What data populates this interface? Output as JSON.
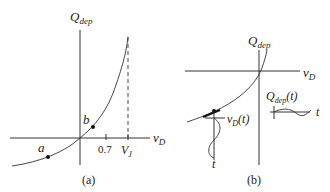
{
  "panel_a": {
    "caption": "(a)",
    "y_label_main": "Q",
    "y_label_sub": "dep",
    "x_label_main": "v",
    "x_label_sub": "D",
    "tick_07": "0.7",
    "tick_vj_main": "V",
    "tick_vj_sub": "J",
    "point_a": "a",
    "point_b": "b"
  },
  "panel_b": {
    "caption": "(b)",
    "y_label_main": "Q",
    "y_label_sub": "dep",
    "x_label_main": "v",
    "x_label_sub": "D",
    "vd_t_main": "v",
    "vd_t_sub": "D",
    "vd_t_arg": "(t)",
    "qdep_t_main": "Q",
    "qdep_t_sub": "dep",
    "qdep_t_arg": "(t)",
    "t_label_1": "t",
    "t_label_2": "t"
  },
  "colors": {
    "ink": "#333333",
    "background": "#ffffff"
  }
}
